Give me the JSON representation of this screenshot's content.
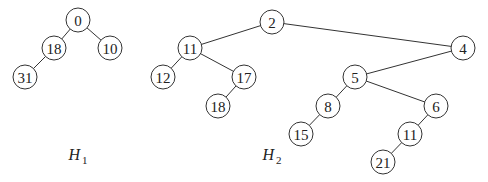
{
  "heaps": [
    {
      "id": "H1",
      "label": "H",
      "label_sub": "1",
      "nodes": [
        {
          "id": "h1n0",
          "key": "0"
        },
        {
          "id": "h1n18",
          "key": "18"
        },
        {
          "id": "h1n10",
          "key": "10"
        },
        {
          "id": "h1n31",
          "key": "31"
        }
      ],
      "edges": [
        [
          "h1n0",
          "h1n18"
        ],
        [
          "h1n0",
          "h1n10"
        ],
        [
          "h1n18",
          "h1n31"
        ]
      ]
    },
    {
      "id": "H2",
      "label": "H",
      "label_sub": "2",
      "nodes": [
        {
          "id": "h2n2",
          "key": "2"
        },
        {
          "id": "h2n11a",
          "key": "11"
        },
        {
          "id": "h2n12",
          "key": "12"
        },
        {
          "id": "h2n17",
          "key": "17"
        },
        {
          "id": "h2n18",
          "key": "18"
        },
        {
          "id": "h2n4",
          "key": "4"
        },
        {
          "id": "h2n5",
          "key": "5"
        },
        {
          "id": "h2n8",
          "key": "8"
        },
        {
          "id": "h2n15",
          "key": "15"
        },
        {
          "id": "h2n6",
          "key": "6"
        },
        {
          "id": "h2n11b",
          "key": "11"
        },
        {
          "id": "h2n21",
          "key": "21"
        }
      ],
      "edges": [
        [
          "h2n2",
          "h2n11a"
        ],
        [
          "h2n2",
          "h2n4"
        ],
        [
          "h2n11a",
          "h2n12"
        ],
        [
          "h2n11a",
          "h2n17"
        ],
        [
          "h2n17",
          "h2n18"
        ],
        [
          "h2n4",
          "h2n5"
        ],
        [
          "h2n5",
          "h2n8"
        ],
        [
          "h2n5",
          "h2n6"
        ],
        [
          "h2n8",
          "h2n15"
        ],
        [
          "h2n6",
          "h2n11b"
        ],
        [
          "h2n11b",
          "h2n21"
        ]
      ]
    }
  ]
}
